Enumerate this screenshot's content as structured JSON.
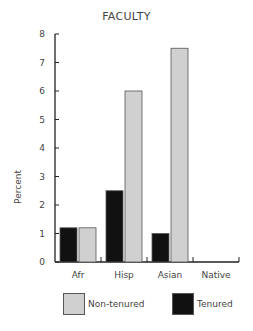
{
  "chart_data": {
    "type": "bar",
    "title": "FACULTY",
    "xlabel": "",
    "ylabel": "Percent",
    "ylim": [
      0,
      8
    ],
    "yticks": [
      0,
      1,
      2,
      3,
      4,
      5,
      6,
      7,
      8
    ],
    "grid": false,
    "categories": [
      "Afr",
      "Hisp",
      "Asian",
      "Native"
    ],
    "series": [
      {
        "name": "Tenured",
        "color": "#111111",
        "values": [
          1.2,
          2.5,
          1.0,
          0
        ]
      },
      {
        "name": "Non-tenured",
        "color": "#d0d0d0",
        "values": [
          1.2,
          6.0,
          7.5,
          0
        ]
      }
    ],
    "legend_position": "bottom"
  },
  "legend": {
    "items": [
      {
        "label": "Non-tenured",
        "color": "#d0d0d0"
      },
      {
        "label": "Tenured",
        "color": "#111111"
      }
    ]
  }
}
